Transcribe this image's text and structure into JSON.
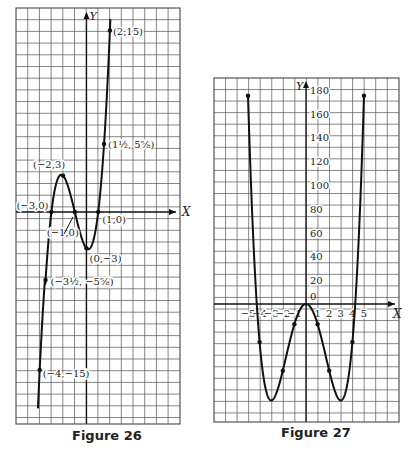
{
  "chart_data": [
    {
      "type": "line",
      "title": "Figure 26",
      "function": "y = x^3 + 3x^2 - x - 3",
      "xlabel": "X",
      "ylabel": "Y",
      "grid": true,
      "xlim": [
        -6,
        8
      ],
      "ylim": [
        -18,
        17
      ],
      "labeled_points": [
        {
          "x": 2,
          "y": 15,
          "label": "(2,15)"
        },
        {
          "x": 1.5,
          "y": 5.625,
          "label": "(1½, 5⅝)"
        },
        {
          "x": -2,
          "y": 3,
          "label": "(−2,3)"
        },
        {
          "x": -3,
          "y": 0,
          "label": "(−3,0)"
        },
        {
          "x": -1,
          "y": 0,
          "label": "(−1,0)"
        },
        {
          "x": 1,
          "y": 0,
          "label": "(1,0)"
        },
        {
          "x": 0,
          "y": -3,
          "label": "(0,−3)"
        },
        {
          "x": -3.5,
          "y": -5.625,
          "label": "(−3½, −5⅝)"
        },
        {
          "x": -4,
          "y": -15,
          "label": "(−4,−15)"
        }
      ],
      "curve_x_range": [
        -4.15,
        2.1
      ]
    },
    {
      "type": "line",
      "title": "Figure 27",
      "function": "y = x^4 - 18x^2",
      "xlabel": "X",
      "ylabel": "Y",
      "grid": true,
      "x_ticks": [
        -5,
        -4,
        -3,
        -2,
        -1,
        1,
        2,
        3,
        4,
        5
      ],
      "x_tick_labels": [
        "−5",
        "−4",
        "−3",
        "−2",
        "−1",
        "1",
        "2",
        "3",
        "4",
        "5"
      ],
      "y_ticks": [
        0,
        20,
        40,
        60,
        80,
        100,
        120,
        140,
        160,
        180
      ],
      "y_tick_labels": [
        "0",
        "20",
        "40",
        "60",
        "80",
        "100",
        "120",
        "140",
        "160",
        "180"
      ],
      "xlim": [
        -8,
        8
      ],
      "ylim": [
        -100,
        190
      ],
      "points": [
        {
          "x": -5,
          "y": 175
        },
        {
          "x": -4,
          "y": -32
        },
        {
          "x": -3,
          "y": -81
        },
        {
          "x": -2,
          "y": -56
        },
        {
          "x": -1,
          "y": -17
        },
        {
          "x": 0,
          "y": 0
        },
        {
          "x": 1,
          "y": -17
        },
        {
          "x": 2,
          "y": -56
        },
        {
          "x": 3,
          "y": -81
        },
        {
          "x": 4,
          "y": -32
        },
        {
          "x": 5,
          "y": 175
        }
      ],
      "curve_x_range": [
        -5,
        5
      ]
    }
  ],
  "figures": {
    "fig26": {
      "caption": "Figure 26",
      "x_axis_label": "X",
      "y_axis_label": "Y"
    },
    "fig27": {
      "caption": "Figure 27",
      "x_axis_label": "X",
      "y_axis_label": "Y",
      "origin_label": "0"
    }
  }
}
